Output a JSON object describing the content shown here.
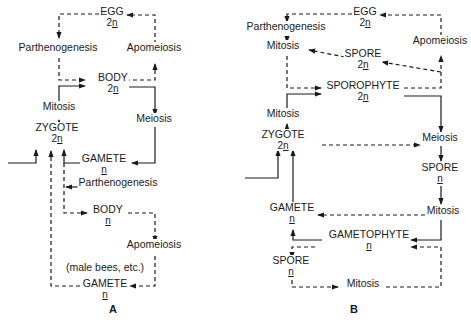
{
  "diagrams": [
    {
      "id": "A",
      "caption": "A",
      "nodes": [
        {
          "id": "a_egg",
          "label": "EGG",
          "ploidy": "2n",
          "x": 112,
          "y": 12
        },
        {
          "id": "a_parth1",
          "label": "Parthenogenesis",
          "ploidy": "",
          "x": 58,
          "y": 48
        },
        {
          "id": "a_apo1",
          "label": "Apomeiosis",
          "ploidy": "",
          "x": 154,
          "y": 48
        },
        {
          "id": "a_body2n",
          "label": "BODY",
          "ploidy": "2n",
          "x": 113,
          "y": 78
        },
        {
          "id": "a_mitosis",
          "label": "Mitosis",
          "ploidy": "",
          "x": 59,
          "y": 107
        },
        {
          "id": "a_meiosis",
          "label": "Meiosis",
          "ploidy": "",
          "x": 154,
          "y": 119
        },
        {
          "id": "a_zygote",
          "label": "ZYGOTE",
          "ploidy": "2n",
          "x": 57,
          "y": 128
        },
        {
          "id": "a_gamete1",
          "label": "GAMETE",
          "ploidy": "n",
          "x": 104,
          "y": 159
        },
        {
          "id": "a_parth2",
          "label": "Parthenogenesis",
          "ploidy": "",
          "x": 118,
          "y": 183
        },
        {
          "id": "a_bodyn",
          "label": "BODY",
          "ploidy": "n",
          "x": 108,
          "y": 210
        },
        {
          "id": "a_apo2",
          "label": "Apomeiosis",
          "ploidy": "",
          "x": 154,
          "y": 245
        },
        {
          "id": "a_note",
          "label": "(male bees, etc.)",
          "ploidy": "",
          "x": 105,
          "y": 268
        },
        {
          "id": "a_gamete2",
          "label": "GAMETE",
          "ploidy": "n",
          "x": 105,
          "y": 284
        }
      ],
      "edges": [
        {
          "from": "EGG",
          "to": "Parthenogenesis",
          "style": "dashed"
        },
        {
          "from": "Parthenogenesis",
          "to": "BODY 2n",
          "style": "dashed"
        },
        {
          "from": "BODY 2n",
          "to": "Apomeiosis",
          "style": "dashed"
        },
        {
          "from": "Apomeiosis",
          "to": "EGG",
          "style": "dashed"
        },
        {
          "from": "BODY 2n",
          "to": "Meiosis",
          "style": "solid"
        },
        {
          "from": "Meiosis",
          "to": "GAMETE n",
          "style": "solid"
        },
        {
          "from": "GAMETE n",
          "to": "ZYGOTE",
          "style": "solid"
        },
        {
          "from": "external",
          "to": "ZYGOTE",
          "style": "solid"
        },
        {
          "from": "ZYGOTE",
          "to": "Mitosis",
          "style": "solid"
        },
        {
          "from": "Mitosis",
          "to": "BODY 2n",
          "style": "solid"
        },
        {
          "from": "GAMETE n",
          "to": "BODY n (Parthenogenesis)",
          "style": "dashed"
        },
        {
          "from": "BODY n",
          "to": "Apomeiosis",
          "style": "dashed"
        },
        {
          "from": "Apomeiosis",
          "to": "GAMETE n (male bees, etc.)",
          "style": "dashed"
        },
        {
          "from": "GAMETE n (male bees, etc.)",
          "to": "ZYGOTE",
          "style": "dashed"
        }
      ]
    },
    {
      "id": "B",
      "caption": "B",
      "nodes": [
        {
          "id": "b_egg",
          "label": "EGG",
          "ploidy": "2n",
          "x": 365,
          "y": 12
        },
        {
          "id": "b_parth",
          "label": "Parthenogenesis",
          "ploidy": "",
          "x": 286,
          "y": 27
        },
        {
          "id": "b_mitosis1",
          "label": "Mitosis",
          "ploidy": "",
          "x": 283,
          "y": 46
        },
        {
          "id": "b_apo",
          "label": "Apomeiosis",
          "ploidy": "",
          "x": 440,
          "y": 41
        },
        {
          "id": "b_spore2n",
          "label": "SPORE",
          "ploidy": "2n",
          "x": 363,
          "y": 54
        },
        {
          "id": "b_sporophyte",
          "label": "SPOROPHYTE",
          "ploidy": "2n",
          "x": 363,
          "y": 86
        },
        {
          "id": "b_mitosis2",
          "label": "Mitosis",
          "ploidy": "",
          "x": 283,
          "y": 114
        },
        {
          "id": "b_zygote",
          "label": "ZYGOTE",
          "ploidy": "2n",
          "x": 283,
          "y": 135
        },
        {
          "id": "b_meiosis",
          "label": "Meiosis",
          "ploidy": "",
          "x": 440,
          "y": 138
        },
        {
          "id": "b_sporen1",
          "label": "SPORE",
          "ploidy": "n",
          "x": 440,
          "y": 168
        },
        {
          "id": "b_gamete",
          "label": "GAMETE",
          "ploidy": "n",
          "x": 292,
          "y": 208
        },
        {
          "id": "b_mitosis3",
          "label": "Mitosis",
          "ploidy": "",
          "x": 443,
          "y": 211
        },
        {
          "id": "b_gametophyte",
          "label": "GAMETOPHYTE",
          "ploidy": "n",
          "x": 369,
          "y": 235
        },
        {
          "id": "b_sporen2",
          "label": "SPORE",
          "ploidy": "n",
          "x": 291,
          "y": 261
        },
        {
          "id": "b_mitosis4",
          "label": "Mitosis",
          "ploidy": "",
          "x": 363,
          "y": 284
        }
      ],
      "edges": [
        {
          "from": "EGG",
          "to": "Parthenogenesis",
          "style": "dashed"
        },
        {
          "from": "Parthenogenesis",
          "to": "Mitosis",
          "style": "dashed"
        },
        {
          "from": "Mitosis",
          "to": "SPOROPHYTE",
          "style": "dashed"
        },
        {
          "from": "SPOROPHYTE",
          "to": "Apomeiosis",
          "style": "dashed"
        },
        {
          "from": "Apomeiosis",
          "to": "EGG",
          "style": "dashed"
        },
        {
          "from": "Apomeiosis",
          "to": "SPORE 2n",
          "style": "dashed"
        },
        {
          "from": "SPORE 2n",
          "to": "Mitosis",
          "style": "dashed"
        },
        {
          "from": "SPOROPHYTE",
          "to": "Meiosis",
          "style": "solid"
        },
        {
          "from": "Meiosis",
          "to": "SPORE n",
          "style": "solid"
        },
        {
          "from": "SPORE n",
          "to": "Mitosis",
          "style": "solid"
        },
        {
          "from": "Mitosis",
          "to": "GAMETOPHYTE",
          "style": "solid"
        },
        {
          "from": "Mitosis",
          "to": "GAMETE",
          "style": "dashed"
        },
        {
          "from": "GAMETOPHYTE",
          "to": "GAMETE",
          "style": "solid"
        },
        {
          "from": "GAMETE",
          "to": "ZYGOTE",
          "style": "solid"
        },
        {
          "from": "external",
          "to": "ZYGOTE",
          "style": "solid"
        },
        {
          "from": "ZYGOTE",
          "to": "Mitosis",
          "style": "solid"
        },
        {
          "from": "Mitosis",
          "to": "SPOROPHYTE",
          "style": "solid"
        },
        {
          "from": "ZYGOTE",
          "to": "Meiosis",
          "style": "dashed"
        },
        {
          "from": "GAMETOPHYTE",
          "to": "SPORE n",
          "style": "dashed"
        },
        {
          "from": "SPORE n",
          "to": "Mitosis",
          "style": "dashed"
        },
        {
          "from": "Mitosis",
          "to": "GAMETOPHYTE",
          "style": "dashed"
        }
      ]
    }
  ],
  "captions": {
    "a": "A",
    "b": "B"
  },
  "paths": {
    "a": [
      {
        "d": "M99,14 H59 V38",
        "dash": true,
        "arrow": "end"
      },
      {
        "d": "M59,58 V80 H85",
        "dash": true,
        "arrow": "end"
      },
      {
        "d": "M126,80 H155 V64",
        "dash": true,
        "arrow": "end"
      },
      {
        "d": "M155,44 V15 H127",
        "dash": true,
        "arrow": "end"
      },
      {
        "d": "M59,103 V86 H85",
        "dash": false,
        "arrow": "end"
      },
      {
        "d": "M59,127 V120",
        "dash": false,
        "arrow": "end"
      },
      {
        "d": "M126,87 H155 V115",
        "dash": false,
        "arrow": "end"
      },
      {
        "d": "M155,127 V163 H132",
        "dash": false,
        "arrow": "end"
      },
      {
        "d": "M80,163 H64 V150",
        "dash": false,
        "arrow": "end"
      },
      {
        "d": "M8,163 H36 V150",
        "dash": false,
        "arrow": "end"
      },
      {
        "d": "M64,163 V213 H87",
        "dash": true,
        "arrow": "end"
      },
      {
        "d": "M78,187 H66",
        "dash": false,
        "arrow": "end"
      },
      {
        "d": "M128,213 H155 V242",
        "dash": true,
        "arrow": "end"
      },
      {
        "d": "M155,256 V286 H130",
        "dash": true,
        "arrow": "end"
      },
      {
        "d": "M80,286 H51 V151",
        "dash": true,
        "arrow": "end"
      }
    ],
    "b": [
      {
        "d": "M352,14 H287 V22",
        "dash": true,
        "arrow": "end"
      },
      {
        "d": "M287,37 V42",
        "dash": false,
        "arrow": "end"
      },
      {
        "d": "M287,56 V88 H321",
        "dash": true,
        "arrow": "end"
      },
      {
        "d": "M404,88 H441 V56",
        "dash": true,
        "arrow": "end"
      },
      {
        "d": "M441,36 V15 H380",
        "dash": true,
        "arrow": "end"
      },
      {
        "d": "M441,72 L382,62",
        "dash": true,
        "arrow": "end"
      },
      {
        "d": "M345,57 L309,50",
        "dash": true,
        "arrow": "end"
      },
      {
        "d": "M287,110 V94 H321",
        "dash": false,
        "arrow": "end"
      },
      {
        "d": "M287,131 V124",
        "dash": false,
        "arrow": "end"
      },
      {
        "d": "M404,96 H441 V132",
        "dash": false,
        "arrow": "end"
      },
      {
        "d": "M441,146 V161",
        "dash": false,
        "arrow": "end"
      },
      {
        "d": "M441,186 V204",
        "dash": false,
        "arrow": "end"
      },
      {
        "d": "M425,215 H318",
        "dash": true,
        "arrow": "end"
      },
      {
        "d": "M441,220 V240 H411",
        "dash": false,
        "arrow": "end"
      },
      {
        "d": "M322,240 H293 V230",
        "dash": false,
        "arrow": "end"
      },
      {
        "d": "M293,209 V150",
        "dash": false,
        "arrow": "end"
      },
      {
        "d": "M245,178 H278 V150",
        "dash": false,
        "arrow": "end"
      },
      {
        "d": "M322,145 H420",
        "dash": true,
        "arrow": "end"
      },
      {
        "d": "M315,247 H292 V258",
        "dash": true,
        "arrow": "end"
      },
      {
        "d": "M292,280 V287 H338",
        "dash": true,
        "arrow": "end"
      },
      {
        "d": "M386,287 H441 V247 H411",
        "dash": true,
        "arrow": "end"
      }
    ]
  }
}
